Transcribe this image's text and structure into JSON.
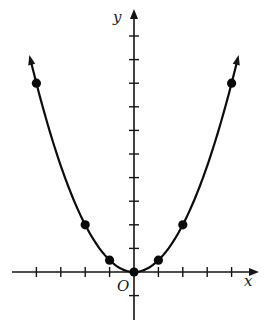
{
  "chart_data": {
    "type": "line",
    "title": "",
    "function": "y = x^2 / 2",
    "xlabel": "x",
    "ylabel": "y",
    "origin_label": "O",
    "xlim": [
      -4.25,
      4.25
    ],
    "ylim": [
      -2,
      10.5
    ],
    "x_ticks": [
      -4,
      -3,
      -2,
      -1,
      1,
      2,
      3,
      4
    ],
    "y_ticks": [
      -1,
      1,
      2,
      3,
      4,
      5,
      6,
      7,
      8,
      9,
      10
    ],
    "tick_labels_shown": false,
    "grid": false,
    "legend": null,
    "series": [
      {
        "name": "parabola",
        "style": "smooth curve with arrowheads at both ends",
        "points": [
          {
            "x": -4,
            "y": 8
          },
          {
            "x": -2,
            "y": 2
          },
          {
            "x": -1,
            "y": 0.5
          },
          {
            "x": 0,
            "y": 0
          },
          {
            "x": 1,
            "y": 0.5
          },
          {
            "x": 2,
            "y": 2
          },
          {
            "x": 4,
            "y": 8
          }
        ]
      }
    ],
    "colors": {
      "ink": "#141414",
      "background": "#ffffff"
    }
  },
  "labels": {
    "x_axis": "x",
    "y_axis": "y",
    "origin": "O"
  }
}
